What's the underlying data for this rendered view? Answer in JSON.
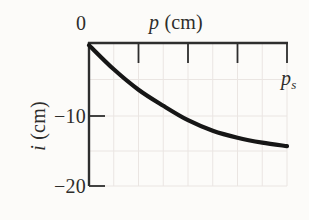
{
  "figure": {
    "background": "#fcfbf9"
  },
  "chart_data": {
    "type": "line",
    "title": "",
    "xlabel": "p (cm)",
    "ylabel": "i (cm)",
    "grid": true,
    "x_axis": {
      "var": "p",
      "unit": "(cm)",
      "position": "top",
      "origin_label": "0",
      "ticks_unlabeled": true,
      "tick_fractions": [
        0.25,
        0.5,
        0.75,
        1
      ],
      "gridline_fractions": [
        0.125,
        0.25,
        0.375,
        0.5,
        0.625,
        0.75,
        0.875,
        1
      ]
    },
    "y_axis": {
      "var": "i",
      "unit": "(cm)",
      "position": "left",
      "range": [
        -20,
        0
      ],
      "tick_values": [
        0,
        -10,
        -20
      ],
      "tick_labels": [
        "0",
        "−10",
        "−20"
      ],
      "gridline_values": [
        -5,
        -10,
        -15,
        -20
      ]
    },
    "annotation": {
      "text": "ps",
      "base": "p",
      "sub": "s",
      "position": "below right end of top axis"
    },
    "series": [
      {
        "name": "i vs p",
        "points": [
          [
            0,
            -0.3
          ],
          [
            0.125,
            -3.6
          ],
          [
            0.25,
            -6.4
          ],
          [
            0.375,
            -8.6
          ],
          [
            0.5,
            -10.6
          ],
          [
            0.625,
            -12.1
          ],
          [
            0.75,
            -13.1
          ],
          [
            0.875,
            -13.8
          ],
          [
            1,
            -14.3
          ]
        ]
      }
    ],
    "colors": {
      "curve": "#161616",
      "axis": "#2e2e2e",
      "grid": "#eae5e2",
      "text": "#2e2d2b",
      "background": "#fcfbf9"
    }
  }
}
